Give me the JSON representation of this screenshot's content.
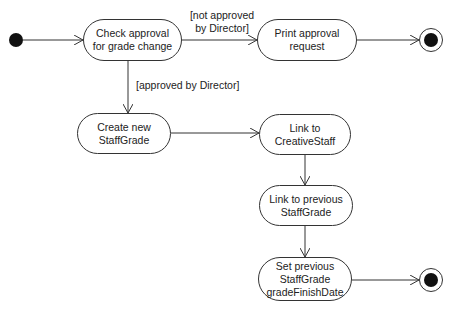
{
  "diagram": {
    "type": "UML activity diagram",
    "nodes": {
      "start": {
        "kind": "initial"
      },
      "check": {
        "label": "Check approval\nfor grade change"
      },
      "print": {
        "label": "Print approval\nrequest"
      },
      "end1": {
        "kind": "final"
      },
      "create": {
        "label": "Create new\nStaffGrade"
      },
      "link_creative": {
        "label": "Link to\nCreativeStaff"
      },
      "link_previous": {
        "label": "Link to previous\nStaffGrade"
      },
      "set_previous": {
        "label": "Set previous\nStaffGrade\ngradeFinishDate"
      },
      "end2": {
        "kind": "final"
      }
    },
    "guards": {
      "not_approved": "[not approved\nby Director]",
      "approved": "[approved by Director]"
    },
    "edges": [
      {
        "from": "start",
        "to": "check"
      },
      {
        "from": "check",
        "to": "print",
        "guard": "not_approved"
      },
      {
        "from": "print",
        "to": "end1"
      },
      {
        "from": "check",
        "to": "create",
        "guard": "approved"
      },
      {
        "from": "create",
        "to": "link_creative"
      },
      {
        "from": "link_creative",
        "to": "link_previous"
      },
      {
        "from": "link_previous",
        "to": "set_previous"
      },
      {
        "from": "set_previous",
        "to": "end2"
      }
    ],
    "colors": {
      "line": "#333333",
      "fill": "#ffffff",
      "dot": "#111111"
    }
  }
}
